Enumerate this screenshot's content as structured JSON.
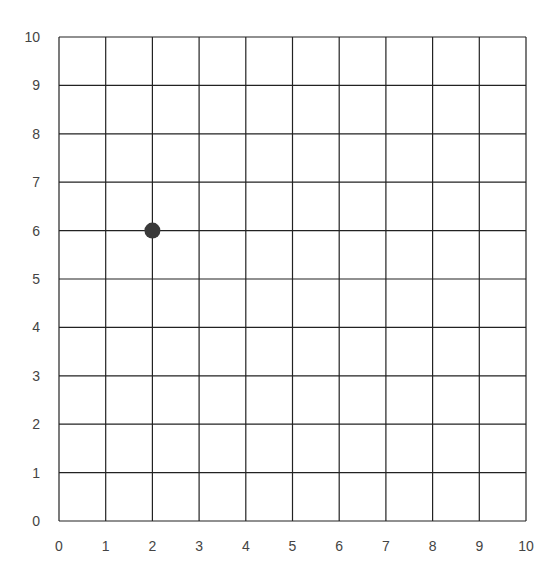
{
  "chart_data": {
    "type": "scatter",
    "title": "",
    "xlabel": "",
    "ylabel": "",
    "xlim": [
      0,
      10
    ],
    "ylim": [
      0,
      10
    ],
    "grid": true,
    "x_ticks": [
      "0",
      "1",
      "2",
      "3",
      "4",
      "5",
      "6",
      "7",
      "8",
      "9",
      "10"
    ],
    "y_ticks": [
      "0",
      "1",
      "2",
      "3",
      "4",
      "5",
      "6",
      "7",
      "8",
      "9",
      "10"
    ],
    "points": [
      {
        "x": 2,
        "y": 6
      }
    ],
    "colors": {
      "grid": "#222222",
      "point": "#3a3a3a",
      "tick_text": "#444444"
    }
  }
}
